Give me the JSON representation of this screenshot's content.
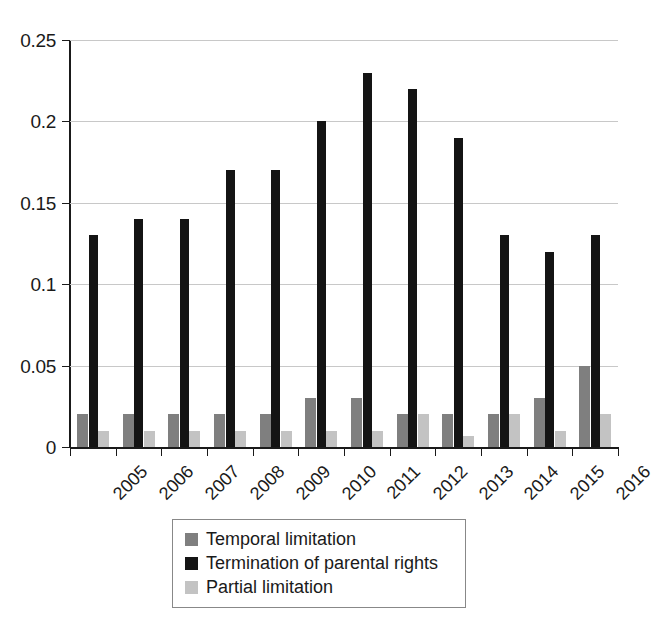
{
  "chart_data": {
    "type": "bar",
    "title": "",
    "subtitle": "",
    "xlabel": "",
    "ylabel": "",
    "grid": true,
    "legend_position": "bottom-center",
    "ylim": [
      0,
      0.25
    ],
    "yticks": [
      "0",
      "0.05",
      "0.1",
      "0.15",
      "0.2",
      "0.25"
    ],
    "ytick_values": [
      0,
      0.05,
      0.1,
      0.15,
      0.2,
      0.25
    ],
    "categories": [
      "2005",
      "2006",
      "2007",
      "2008",
      "2009",
      "2010",
      "2011",
      "2012",
      "2013",
      "2014",
      "2015",
      "2016"
    ],
    "series": [
      {
        "name": "Temporal limitation",
        "color": "#7f7f7f",
        "values": [
          0.02,
          0.02,
          0.02,
          0.02,
          0.02,
          0.03,
          0.03,
          0.02,
          0.02,
          0.02,
          0.03,
          0.05
        ]
      },
      {
        "name": "Termination of parental rights",
        "color": "#141414",
        "values": [
          0.13,
          0.14,
          0.14,
          0.17,
          0.17,
          0.2,
          0.23,
          0.22,
          0.19,
          0.13,
          0.12,
          0.13
        ]
      },
      {
        "name": "Partial limitation",
        "color": "#c3c3c3",
        "values": [
          0.01,
          0.01,
          0.01,
          0.01,
          0.01,
          0.01,
          0.01,
          0.02,
          0.007,
          0.02,
          0.01,
          0.02
        ]
      }
    ]
  },
  "legend": {
    "items": [
      {
        "label": "Temporal limitation",
        "color": "#7f7f7f"
      },
      {
        "label": "Termination of parental rights",
        "color": "#141414"
      },
      {
        "label": "Partial limitation",
        "color": "#c3c3c3"
      }
    ]
  },
  "axis_colors": {
    "gridline": "#c8c8c8",
    "axis": "#1a1a1a"
  }
}
